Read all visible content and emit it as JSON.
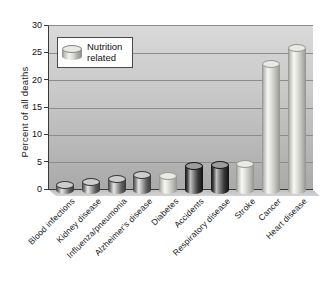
{
  "figure": {
    "ylabel": "Percent of all deaths",
    "legend": {
      "line1": "Nutrition",
      "line2": "related"
    }
  },
  "chart_data": {
    "type": "bar",
    "title": "",
    "xlabel": "",
    "ylabel": "Percent of all deaths",
    "ylim": [
      0,
      30
    ],
    "yticks": [
      0,
      5,
      10,
      15,
      20,
      25,
      30
    ],
    "grid": true,
    "legend": {
      "label": "Nutrition related",
      "style": "light",
      "position": "upper-left"
    },
    "categories": [
      "Blood infections",
      "Kidney disease",
      "Influenza/pneumonia",
      "Alzheimer's disease",
      "Diabetes",
      "Accidents",
      "Respiratory disease",
      "Stroke",
      "Cancer",
      "Heart disease"
    ],
    "values": [
      1,
      1.5,
      2,
      2.8,
      2.5,
      4.4,
      4.5,
      4.8,
      23,
      26
    ],
    "bar_styles": [
      "gray",
      "gray",
      "gray",
      "gray",
      "light",
      "dark",
      "dark",
      "light",
      "light",
      "light"
    ],
    "nutrition_related": [
      false,
      false,
      false,
      false,
      true,
      false,
      false,
      true,
      true,
      true
    ],
    "colors": {
      "plot_bg_top": "#d9d9d9",
      "plot_bg_bottom": "#a9a9a9",
      "gridline": "#8c8c8c",
      "axis": "#3a3a3a",
      "text": "#1a1a1a",
      "bar_gray_highlight": "#e8e8e8",
      "bar_gray_edge": "#3f3f3f",
      "bar_dark_highlight": "#c2c2c2",
      "bar_dark_edge": "#141414",
      "bar_light_highlight": "#f7f7f4",
      "bar_light_edge": "#8f8f8b",
      "floor": "#c6c6c6",
      "legend_bg": "#ffffff"
    }
  }
}
